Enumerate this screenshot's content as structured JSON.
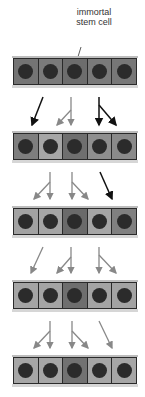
{
  "diagram": {
    "label": "immortal stem cell",
    "label_lines": [
      "immortal",
      "stem cell"
    ],
    "colors": {
      "dark_cell": "#6f6f6f",
      "mid_cell": "#8c8c8c",
      "light_cell": "#a9a9a9",
      "nucleus": "#2b2b2b",
      "arrow_dark": "#111111",
      "arrow_light": "#888888"
    },
    "rows": [
      {
        "top": 58,
        "cells": [
          "#747474",
          "#7a7a7a",
          "#6d6d6d",
          "#7a7a7a",
          "#777777"
        ]
      },
      {
        "top": 133,
        "cells": [
          "#7e7e7e",
          "#a6a6a6",
          "#6f6f6f",
          "#8f8f8f",
          "#8a8a8a"
        ]
      },
      {
        "top": 208,
        "cells": [
          "#a2a2a2",
          "#a5a5a5",
          "#6a6a6a",
          "#a6a6a6",
          "#808080"
        ]
      },
      {
        "top": 282,
        "cells": [
          "#a4a4a4",
          "#a4a4a4",
          "#6e6e6e",
          "#a4a4a4",
          "#a3a3a3"
        ]
      },
      {
        "top": 357,
        "cells": [
          "#a6a6a6",
          "#a6a6a6",
          "#727272",
          "#a6a6a6",
          "#a6a6a6"
        ]
      }
    ]
  }
}
